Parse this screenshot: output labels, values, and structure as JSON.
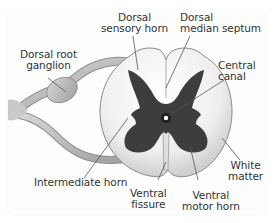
{
  "diagram": {
    "colors": {
      "gray_matter": "#3d3d3d",
      "white_matter": "#ececec",
      "nerve": "#b5b5b5",
      "label_text": "#333333",
      "leader_line": "#555555"
    },
    "labels": [
      {
        "id": "dorsal-sensory-horn",
        "lines": [
          "Dorsal",
          "sensory horn"
        ]
      },
      {
        "id": "dorsal-median-septum",
        "lines": [
          "Dorsal",
          "median septum"
        ]
      },
      {
        "id": "dorsal-root-ganglion",
        "lines": [
          "Dorsal root",
          "ganglion"
        ]
      },
      {
        "id": "central-canal",
        "lines": [
          "Central",
          "canal"
        ]
      },
      {
        "id": "white-matter",
        "lines": [
          "White",
          "matter"
        ]
      },
      {
        "id": "intermediate-horn",
        "lines": [
          "Intermediate horn"
        ]
      },
      {
        "id": "ventral-fissure",
        "lines": [
          "Ventral",
          "fissure"
        ]
      },
      {
        "id": "ventral-motor-horn",
        "lines": [
          "Ventral",
          "motor horn"
        ]
      }
    ]
  }
}
